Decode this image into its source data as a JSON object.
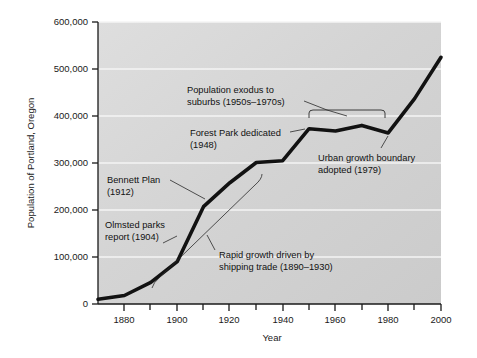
{
  "chart_data": {
    "type": "line",
    "title": "",
    "xlabel": "Year",
    "ylabel": "Population of Portland, Oregon",
    "xlim": [
      1870,
      2000
    ],
    "ylim": [
      0,
      600000
    ],
    "grid": true,
    "legend": "none",
    "x_ticks": [
      "1880",
      "1900",
      "1920",
      "1940",
      "1960",
      "1980",
      "2000"
    ],
    "x_tick_values": [
      1880,
      1900,
      1920,
      1940,
      1960,
      1980,
      2000
    ],
    "y_ticks": [
      "0",
      "100,000",
      "200,000",
      "300,000",
      "400,000",
      "500,000",
      "600,000"
    ],
    "y_tick_values": [
      0,
      100000,
      200000,
      300000,
      400000,
      500000,
      600000
    ],
    "x": [
      1870,
      1880,
      1890,
      1900,
      1910,
      1920,
      1930,
      1940,
      1950,
      1960,
      1970,
      1980,
      1990,
      2000
    ],
    "values": [
      10000,
      18000,
      46000,
      90000,
      207000,
      258000,
      301000,
      305000,
      373000,
      368000,
      380000,
      364000,
      437000,
      525000
    ],
    "series": [
      {
        "name": "Population of Portland, Oregon",
        "values": [
          10000,
          18000,
          46000,
          90000,
          207000,
          258000,
          301000,
          305000,
          373000,
          368000,
          380000,
          364000,
          437000,
          525000
        ]
      }
    ],
    "annotations": [
      {
        "id": "population-exodus",
        "line1": "Population exodus to",
        "line2": "suburbs (1950s–1970s)",
        "target_x_range": [
          1950,
          1980
        ],
        "marker": "bracket"
      },
      {
        "id": "forest-park",
        "line1": "Forest Park dedicated",
        "line2": "(1948)",
        "target_x": 1950,
        "marker": "leader-line"
      },
      {
        "id": "urban-growth-boundary",
        "line1": "Urban growth boundary",
        "line2": "adopted (1979)",
        "target_x": 1980,
        "marker": "leader-line"
      },
      {
        "id": "bennett-plan",
        "line1": "Bennett Plan",
        "line2": "(1912)",
        "target_x": 1912,
        "marker": "leader-line"
      },
      {
        "id": "olmsted-parks",
        "line1": "Olmsted parks",
        "line2": "report (1904)",
        "target_x": 1904,
        "marker": "leader-line"
      },
      {
        "id": "rapid-growth",
        "line1": "Rapid growth driven by",
        "line2": "shipping trade (1890–1930)",
        "target_x_range": [
          1890,
          1930
        ],
        "marker": "curve"
      }
    ],
    "colors": {
      "plot_background": "#d3d3d3",
      "line": "#111111",
      "gridline": "#f2f2f2",
      "axis": "#1a1a1a",
      "text": "#111111",
      "page_background": "#ffffff"
    }
  }
}
